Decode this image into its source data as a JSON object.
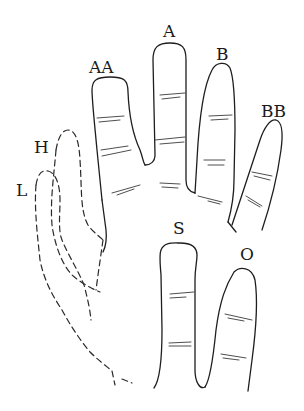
{
  "diagram": {
    "type": "hand line drawing",
    "stroke_color": "#1e1e1e",
    "background": "#ffffff",
    "labels": {
      "AA": "AA",
      "A": "A",
      "B": "B",
      "BB": "BB",
      "H": "H",
      "L": "L",
      "S": "S",
      "O": "O"
    },
    "elements": [
      {
        "id": "AA",
        "kind": "finger",
        "style": "solid"
      },
      {
        "id": "A",
        "kind": "finger",
        "style": "solid"
      },
      {
        "id": "B",
        "kind": "finger",
        "style": "solid"
      },
      {
        "id": "BB",
        "kind": "finger",
        "style": "solid"
      },
      {
        "id": "H",
        "kind": "thumb-outline",
        "style": "dashed"
      },
      {
        "id": "L",
        "kind": "thumb-outline",
        "style": "dashed"
      },
      {
        "id": "S",
        "kind": "detached-finger",
        "style": "solid"
      },
      {
        "id": "O",
        "kind": "detached-finger",
        "style": "solid"
      }
    ]
  }
}
